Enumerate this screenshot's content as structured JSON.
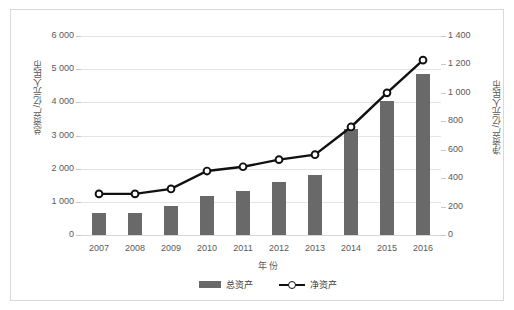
{
  "chart_data": {
    "type": "bar",
    "title": "",
    "categories": [
      "2007",
      "2008",
      "2009",
      "2010",
      "2011",
      "2012",
      "2013",
      "2014",
      "2015",
      "2016"
    ],
    "xlabel": "年 份",
    "series": [
      {
        "name": "总资产",
        "type": "bar",
        "axis": "left",
        "unit": "亿元人民币",
        "values": [
          660,
          660,
          860,
          1180,
          1330,
          1590,
          1800,
          3200,
          4050,
          4840
        ]
      },
      {
        "name": "净资产",
        "type": "line",
        "axis": "right",
        "unit": "亿元人民币",
        "values": [
          289,
          289,
          324,
          450,
          480,
          530,
          565,
          760,
          1000,
          1230
        ]
      }
    ],
    "left_axis": {
      "label": "总资产/亿元人民币",
      "ticks": [
        "0",
        "1 000",
        "2 000",
        "3 000",
        "4 000",
        "5 000",
        "6 000"
      ],
      "min": 0,
      "max": 6000,
      "step": 1000
    },
    "right_axis": {
      "label": "净资产/亿元人民币",
      "ticks": [
        "0",
        "200",
        "400",
        "600",
        "800",
        "1 000",
        "1 200",
        "1 400"
      ],
      "min": 0,
      "max": 1400,
      "step": 200
    },
    "grid": true,
    "legend_position": "bottom",
    "colors": {
      "bar": "#696969",
      "line": "#111111",
      "marker_fill": "#ffffff",
      "grid": "#e4e4e4",
      "text": "#595959",
      "frame": "#d9d9d9"
    }
  }
}
